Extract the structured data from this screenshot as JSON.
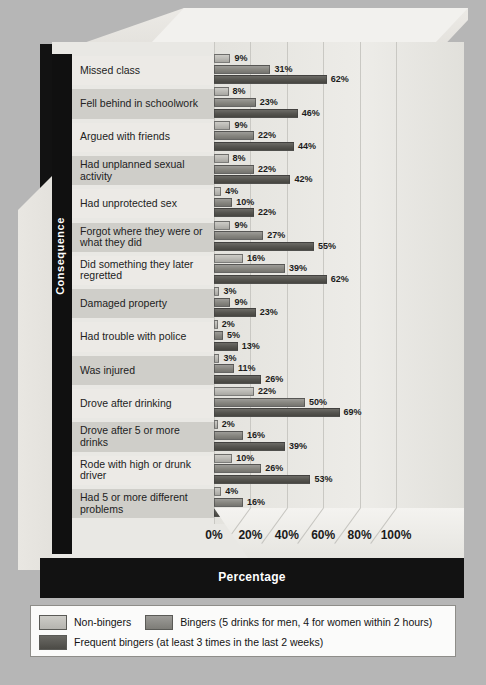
{
  "chart_data": {
    "type": "bar",
    "orientation": "horizontal",
    "title": "",
    "xlabel": "Percentage",
    "ylabel": "Consequence",
    "xlim": [
      0,
      110
    ],
    "xticks": [
      "0%",
      "20%",
      "40%",
      "60%",
      "80%",
      "100%"
    ],
    "xtick_values": [
      0,
      20,
      40,
      60,
      80,
      100
    ],
    "grid": true,
    "legend_position": "bottom",
    "categories": [
      "Missed class",
      "Fell behind in schoolwork",
      "Argued with friends",
      "Had unplanned sexual activity",
      "Had unprotected sex",
      "Forgot where they were or what they did",
      "Did something they later regretted",
      "Damaged property",
      "Had trouble with police",
      "Was injured",
      "Drove after drinking",
      "Drove after 5 or more drinks",
      "Rode with high or drunk driver",
      "Had 5 or more different problems"
    ],
    "series": [
      {
        "name": "Non-bingers",
        "color": "#b9b8b3",
        "values": [
          9,
          8,
          9,
          8,
          4,
          9,
          16,
          3,
          2,
          3,
          22,
          2,
          10,
          4
        ],
        "labels": [
          "9%",
          "8%",
          "9%",
          "8%",
          "4%",
          "9%",
          "16%",
          "3%",
          "2%",
          "3%",
          "22%",
          "2%",
          "10%",
          "4%"
        ]
      },
      {
        "name": "Bingers",
        "color": "#86857f",
        "values": [
          31,
          23,
          22,
          22,
          10,
          27,
          39,
          9,
          5,
          11,
          50,
          16,
          26,
          16
        ],
        "labels": [
          "31%",
          "23%",
          "22%",
          "22%",
          "10%",
          "27%",
          "39%",
          "9%",
          "5%",
          "11%",
          "50%",
          "16%",
          "26%",
          "16%"
        ]
      },
      {
        "name": "Frequent bingers",
        "color": "#54534e",
        "values": [
          62,
          46,
          44,
          42,
          22,
          55,
          62,
          23,
          13,
          26,
          69,
          39,
          53,
          48
        ],
        "labels": [
          "62%",
          "46%",
          "44%",
          "42%",
          "22%",
          "55%",
          "62%",
          "23%",
          "13%",
          "26%",
          "69%",
          "39%",
          "53%",
          "48%"
        ]
      }
    ]
  },
  "axis": {
    "y_title": "Consequence",
    "x_title": "Percentage"
  },
  "legend": {
    "entries": [
      {
        "label": "Non-bingers",
        "swatch": "s0"
      },
      {
        "label": "Bingers (5 drinks for men, 4 for women within 2 hours)",
        "swatch": "s1"
      },
      {
        "label": "Frequent bingers (at least 3 times in the last 2 weeks)",
        "swatch": "s2"
      }
    ]
  },
  "colors": {
    "background": "#b6b6b6",
    "frame": "#121212",
    "plot_background": "#e9e8e4",
    "series_light": "#b9b8b3",
    "series_medium": "#86857f",
    "series_dark": "#54534e"
  }
}
